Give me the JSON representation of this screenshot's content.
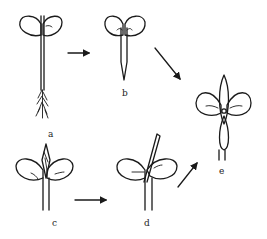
{
  "diagram": {
    "type": "seedling-stages",
    "stroke_color": "#1a1a1a",
    "background": "#ffffff",
    "stages": [
      {
        "id": "a",
        "label": "a",
        "description": "seedling with two cotyledons, long stem and fibrous root"
      },
      {
        "id": "b",
        "label": "b",
        "description": "cut seedling, cotyledons with pointed stem base"
      },
      {
        "id": "c",
        "label": "c",
        "description": "two cotyledons with apical bud (wedge) inserted"
      },
      {
        "id": "d",
        "label": "d",
        "description": "two cotyledons with a slanted scion inserted"
      },
      {
        "id": "e",
        "label": "e",
        "description": "resulting four-leaved cross-shaped plant"
      }
    ],
    "arrows": [
      {
        "from": "a",
        "to": "b",
        "direction": "right"
      },
      {
        "from": "b",
        "to": "e",
        "direction": "down-right"
      },
      {
        "from": "c",
        "to": "d",
        "direction": "right"
      },
      {
        "from": "d",
        "to": "e",
        "direction": "up-right"
      }
    ]
  }
}
